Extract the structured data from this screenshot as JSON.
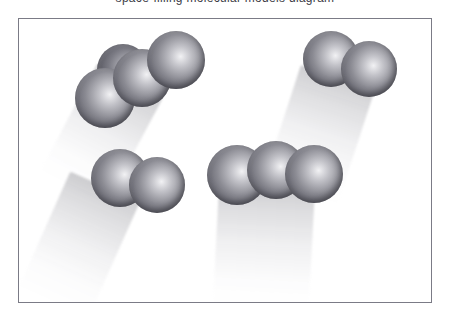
{
  "figure": {
    "top_caption_fragment": "space-filling molecular models diagram",
    "panel_background_color": "#ffffff",
    "frame_border_color": "#7b7b86",
    "atom_base_color": "#8b8b93",
    "atom_highlight_color": "#f2f2f4",
    "atom_shade_color": "#4c4c55",
    "shadow_color": "#c8c8ce",
    "molecule_count": 4,
    "molecules": [
      {
        "id": "molecule-top-left",
        "name": "top-left-cluster",
        "atom_count": 3,
        "hidden_atom_count": 1,
        "orientation": "diagonal-up-right",
        "atoms": [
          {
            "label": "atom-behind"
          },
          {
            "label": "atom-1"
          },
          {
            "label": "atom-2"
          },
          {
            "label": "atom-3"
          }
        ]
      },
      {
        "id": "molecule-top-right",
        "name": "top-right-cluster",
        "atom_count": 2,
        "hidden_atom_count": 0,
        "orientation": "horizontal-pair",
        "atoms": [
          {
            "label": "atom-1"
          },
          {
            "label": "atom-2"
          }
        ]
      },
      {
        "id": "molecule-bottom-left",
        "name": "bottom-left-cluster",
        "atom_count": 2,
        "hidden_atom_count": 0,
        "orientation": "horizontal-pair",
        "atoms": [
          {
            "label": "atom-1"
          },
          {
            "label": "atom-2"
          }
        ]
      },
      {
        "id": "molecule-center",
        "name": "center-bottom-cluster",
        "atom_count": 3,
        "hidden_atom_count": 0,
        "orientation": "horizontal-triple",
        "atoms": [
          {
            "label": "atom-1"
          },
          {
            "label": "atom-2"
          },
          {
            "label": "atom-3"
          }
        ]
      }
    ]
  }
}
